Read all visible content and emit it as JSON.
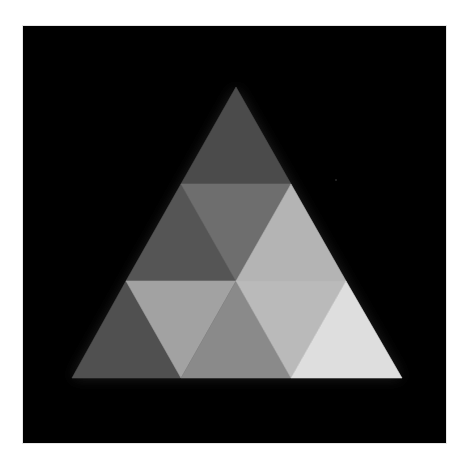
{
  "figure": {
    "title": "Subdivided triangle of nine grayscale triangles",
    "background_color": "#000000",
    "frame_color": "#ffffff",
    "outer_triangle": {
      "apex": [
        236,
        87
      ],
      "bottom_left": [
        72,
        378
      ],
      "bottom_right": [
        402,
        378
      ]
    },
    "rows": 3,
    "triangles": [
      {
        "id": "r0-up-0",
        "row": 0,
        "orientation": "up",
        "points": "236,87 181,184 291,184",
        "fill": "#4b4b4b"
      },
      {
        "id": "r1-up-0",
        "row": 1,
        "orientation": "up",
        "points": "181,184 126,281 236,281",
        "fill": "#555555"
      },
      {
        "id": "r1-down-0",
        "row": 1,
        "orientation": "down",
        "points": "181,184 291,184 236,281",
        "fill": "#6e6e6e"
      },
      {
        "id": "r1-up-1",
        "row": 1,
        "orientation": "up",
        "points": "291,184 236,281 346,281",
        "fill": "#b4b4b4"
      },
      {
        "id": "r2-up-0",
        "row": 2,
        "orientation": "up",
        "points": "126,281 72,378 181,378",
        "fill": "#505050"
      },
      {
        "id": "r2-down-0",
        "row": 2,
        "orientation": "down",
        "points": "126,281 236,281 181,378",
        "fill": "#a2a2a2"
      },
      {
        "id": "r2-up-1",
        "row": 2,
        "orientation": "up",
        "points": "236,281 181,378 291,378",
        "fill": "#8a8a8a"
      },
      {
        "id": "r2-down-1",
        "row": 2,
        "orientation": "down",
        "points": "236,281 346,281 291,378",
        "fill": "#bababa"
      },
      {
        "id": "r2-up-2",
        "row": 2,
        "orientation": "up",
        "points": "346,281 291,378 402,378",
        "fill": "#dedede"
      }
    ]
  }
}
